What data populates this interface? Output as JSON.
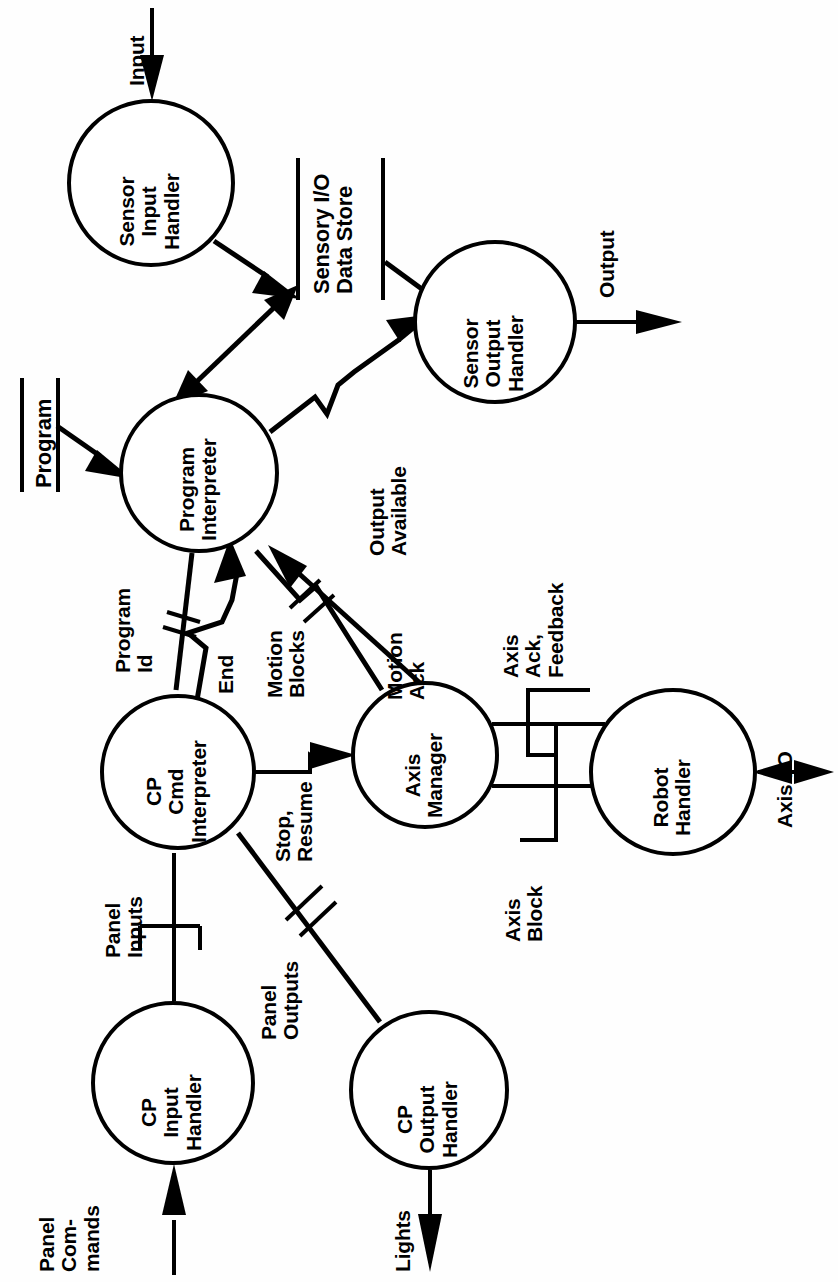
{
  "diagram": {
    "orientation": "rotated-90-ccw",
    "stroke_color": "#000000",
    "background_color": "#ffffff",
    "processes": [
      {
        "id": "sensor-input-handler",
        "label": "Sensor\nInput\nHandler",
        "cx": 151,
        "cy": 183,
        "r": 82
      },
      {
        "id": "sensor-output-handler",
        "label": "Sensor\nOutput\nHandler",
        "cx": 495,
        "cy": 322,
        "r": 80
      },
      {
        "id": "program-interpreter",
        "label": "Program\nInterpreter",
        "cx": 199,
        "cy": 473,
        "r": 78
      },
      {
        "id": "cp-cmd-interpreter",
        "label": "CP\nCmd\nInterpreter",
        "cx": 178,
        "cy": 772,
        "r": 76
      },
      {
        "id": "axis-manager",
        "label": "Axis\nManager",
        "cx": 425,
        "cy": 755,
        "r": 72
      },
      {
        "id": "robot-handler",
        "label": "Robot\nHandler",
        "cx": 673,
        "cy": 772,
        "r": 82
      },
      {
        "id": "cp-input-handler",
        "label": "CP\nInput\nHandler",
        "cx": 173,
        "cy": 1083,
        "r": 80
      },
      {
        "id": "cp-output-handler",
        "label": "CP\nOutput\nHandler",
        "cx": 429,
        "cy": 1090,
        "r": 78
      }
    ],
    "data_stores": [
      {
        "id": "sensory-io-data-store",
        "label": "Sensory I/O\nData Store"
      },
      {
        "id": "program-store",
        "label": "Program"
      }
    ],
    "data_flows": [
      {
        "id": "input",
        "label": "Input"
      },
      {
        "id": "output",
        "label": "Output"
      },
      {
        "id": "output-available",
        "label": "Output\nAvailable"
      },
      {
        "id": "program-id",
        "label": "Program\nId"
      },
      {
        "id": "end",
        "label": "End"
      },
      {
        "id": "motion-blocks",
        "label": "Motion\nBlocks"
      },
      {
        "id": "motion-ack",
        "label": "Motion\nAck"
      },
      {
        "id": "stop-resume",
        "label": "Stop,\nResume"
      },
      {
        "id": "axis-ack-feedback",
        "label": "Axis\nAck,\nFeedback"
      },
      {
        "id": "axis-block",
        "label": "Axis\nBlock"
      },
      {
        "id": "axis-io",
        "label": "Axis I/O"
      },
      {
        "id": "panel-inputs",
        "label": "Panel\nInputs"
      },
      {
        "id": "panel-outputs",
        "label": "Panel\nOutputs"
      },
      {
        "id": "panel-commands",
        "label": "Panel\nCom-\nmands"
      },
      {
        "id": "lights",
        "label": "Lights"
      }
    ]
  }
}
